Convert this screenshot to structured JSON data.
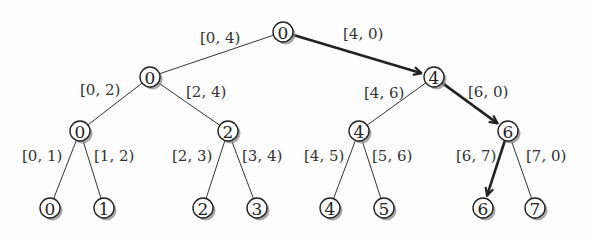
{
  "diagram": {
    "type": "binary-tree",
    "nodes": [
      {
        "id": "n0",
        "label": "0",
        "x": 283,
        "y": 32
      },
      {
        "id": "n1",
        "label": "0",
        "x": 150,
        "y": 77
      },
      {
        "id": "n2",
        "label": "4",
        "x": 434,
        "y": 77
      },
      {
        "id": "n3",
        "label": "0",
        "x": 80,
        "y": 131
      },
      {
        "id": "n4",
        "label": "2",
        "x": 228,
        "y": 131
      },
      {
        "id": "n5",
        "label": "4",
        "x": 359,
        "y": 131
      },
      {
        "id": "n6",
        "label": "6",
        "x": 508,
        "y": 131
      },
      {
        "id": "n7",
        "label": "0",
        "x": 50,
        "y": 208
      },
      {
        "id": "n8",
        "label": "1",
        "x": 104,
        "y": 208
      },
      {
        "id": "n9",
        "label": "2",
        "x": 203,
        "y": 208
      },
      {
        "id": "n10",
        "label": "3",
        "x": 257,
        "y": 208
      },
      {
        "id": "n11",
        "label": "4",
        "x": 330,
        "y": 208
      },
      {
        "id": "n12",
        "label": "5",
        "x": 384,
        "y": 208
      },
      {
        "id": "n13",
        "label": "6",
        "x": 483,
        "y": 208
      },
      {
        "id": "n14",
        "label": "7",
        "x": 535,
        "y": 208
      }
    ],
    "edges": [
      {
        "from": "n0",
        "to": "n1",
        "label": "[0, 4)",
        "lx": 200,
        "ly": 38,
        "highlight": false
      },
      {
        "from": "n0",
        "to": "n2",
        "label": "[4, 0)",
        "lx": 343,
        "ly": 34,
        "highlight": true
      },
      {
        "from": "n1",
        "to": "n3",
        "label": "[0, 2)",
        "lx": 80,
        "ly": 90,
        "highlight": false
      },
      {
        "from": "n1",
        "to": "n4",
        "label": "[2, 4)",
        "lx": 186,
        "ly": 92,
        "highlight": false
      },
      {
        "from": "n2",
        "to": "n5",
        "label": "[4, 6)",
        "lx": 364,
        "ly": 93,
        "highlight": false
      },
      {
        "from": "n2",
        "to": "n6",
        "label": "[6, 0)",
        "lx": 468,
        "ly": 92,
        "highlight": true
      },
      {
        "from": "n3",
        "to": "n7",
        "label": "[0, 1)",
        "lx": 22,
        "ly": 156,
        "highlight": false
      },
      {
        "from": "n3",
        "to": "n8",
        "label": "[1, 2)",
        "lx": 94,
        "ly": 156,
        "highlight": false
      },
      {
        "from": "n4",
        "to": "n9",
        "label": "[2, 3)",
        "lx": 172,
        "ly": 156,
        "highlight": false
      },
      {
        "from": "n4",
        "to": "n10",
        "label": "[3, 4)",
        "lx": 242,
        "ly": 156,
        "highlight": false
      },
      {
        "from": "n5",
        "to": "n11",
        "label": "[4, 5)",
        "lx": 304,
        "ly": 156,
        "highlight": false
      },
      {
        "from": "n5",
        "to": "n12",
        "label": "[5, 6)",
        "lx": 372,
        "ly": 156,
        "highlight": false
      },
      {
        "from": "n6",
        "to": "n13",
        "label": "[6, 7)",
        "lx": 456,
        "ly": 156,
        "highlight": true
      },
      {
        "from": "n6",
        "to": "n14",
        "label": "[7, 0)",
        "lx": 526,
        "ly": 156,
        "highlight": false
      }
    ],
    "node_radius": 10,
    "colors": {
      "stroke": "#222222",
      "highlight": "#222222",
      "shadow": "#8a8a8a",
      "background": "#fdfdfd"
    }
  }
}
